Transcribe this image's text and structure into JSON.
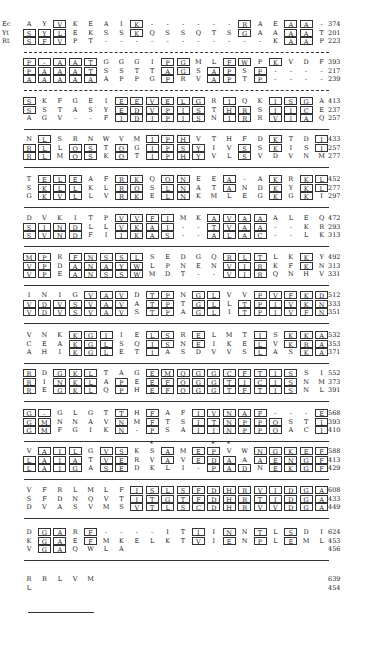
{
  "figure": {
    "species_labels": [
      "Ec",
      "Yt",
      "Rt"
    ],
    "blocks": [
      {
        "rows": [
          {
            "seq": "AYVKEAIK------RAEAA-",
            "box": "..*....*......*..**.",
            "num": "374"
          },
          {
            "seq": "SYLEKSSKQSSQTSGAAAAT",
            "box": "***....*......*..**.",
            "num": "201"
          },
          {
            "seq": "SFVPT-----------KAAP",
            "box": "***..............**.",
            "num": "223"
          }
        ],
        "sep": "dashed"
      },
      {
        "rows": [
          {
            "seq": "P-AATGGGIPGMLFWPKVDF",
            "box": "*****....**..**.*....",
            "num": "393"
          },
          {
            "seq": "PAAATSSTTAGSAPSP----",
            "box": "*****....**.**.*....",
            "num": "217"
          },
          {
            "seq": "AAAAAAPPGPRVAPTP----",
            "box": "*****....*..**.*....",
            "num": "239"
          }
        ],
        "sep": "dashed"
      },
      {
        "rows": [
          {
            "seq": "SKFGEIEEVELGRIQKISGA",
            "box": "*.....******.*..***.",
            "num": "413"
          },
          {
            "seq": "SSTASYEDVPISTHRSIICE",
            "box": "*.....******.**.***.",
            "num": "237"
          },
          {
            "seq": "AGV--FIDIPISNIRRVIAQ",
            "box": "......******.**.***.",
            "num": "257"
          }
        ],
        "sep": "solid"
      },
      {
        "rows": [
          {
            "seq": "NLSRNWVMIPHVTHFDKTDI",
            "box": ".*......***.....*..*",
            "num": "433"
          },
          {
            "seq": "RLLQSTQGIPSYIVSSKISI",
            "box": "**.**.*.****..*.*..*",
            "num": "257"
          },
          {
            "seq": "RLMQSKQTIPHYVLSVDVNM",
            "box": "**.**.*.****..*.....",
            "num": "277"
          }
        ],
        "sep": "solid"
      },
      {
        "rows": [
          {
            "seq": "TELEAFRKQQNEEA-AKRKL",
            "box": ".***..**.**..*..*.**",
            "num": "452"
          },
          {
            "seq": "SKLLKLRQSLNATANDKYKL",
            "box": ".***..**.**..*..*.**",
            "num": "277"
          },
          {
            "seq": "GKVLLVRKELNKMLEGKGKI",
            "box": ".***..**.**.....*.*.",
            "num": "297"
          }
        ],
        "sep": "solid"
      },
      {
        "rows": [
          {
            "seq": "DVKITPVVFIMKAVAAALEQ",
            "box": "......****..****....",
            "num": "472"
          },
          {
            "seq": "SINDLLVKAI--TVAA--KR",
            "box": "****..****..****....",
            "num": "293"
          },
          {
            "seq": "SVNDFIIKAS--ALAC--LK",
            "box": "****..****..****....",
            "num": "313"
          }
        ],
        "sep": "solid"
      },
      {
        "rows": [
          {
            "seq": "MPRFNSSLSEDGQRLTLKKY",
            "box": "**.*****.....***..*.",
            "num": "492"
          },
          {
            "seq": "VPDANAYWLPNENVIRKFKN",
            "box": "**.*****.....***..*.",
            "num": "313"
          },
          {
            "seq": "VPEANSSWMDT--VIRQNHV",
            "box": "**.*****.....***....",
            "num": "331"
          }
        ],
        "sep": "solid"
      },
      {
        "rows": [
          {
            "seq": "INIGVAVDTPNGLVVPVFKD",
            "box": "....***.**.**..*****",
            "num": "512"
          },
          {
            "seq": "VDVSVAVATPTGLLTPIVKN",
            "box": "*******.**.**.******",
            "num": "333"
          },
          {
            "seq": "VDVSVAVSTPAGLITPIVFN",
            "box": "*******.**.**.******",
            "num": "351"
          }
        ],
        "sep": "solid"
      },
      {
        "rows": [
          {
            "seq": "VNKKGIIELSRELMTISKKA",
            "box": "...***..**.*...*.***",
            "num": "532"
          },
          {
            "seq": "CEAKGLSQISNEIKELVKRA",
            "box": "...***..**.*...*.***",
            "num": "353"
          },
          {
            "seq": "AHIKGLETIASDVVSLASKA",
            "box": "...***..*......*..**",
            "num": "371"
          }
        ],
        "sep": "solid"
      },
      {
        "rows": [
          {
            "seq": "RDGKLTAGEMQGGCFTISSI",
            "box": "*.***...**********..",
            "num": "552"
          },
          {
            "seq": "RINKLAPEEFQGGTICISNM",
            "box": "*.***.*.**********..",
            "num": "373"
          },
          {
            "seq": "REGKLQPHEFQGGTFTISNL",
            "box": "*.***.*.**********..",
            "num": "391"
          }
        ],
        "sep": "solid"
      },
      {
        "rows": [
          {
            "seq": "G-GLGTTHFAFIVNAF---E",
            "box": "**....*.*..*****...*",
            "num": "568"
          },
          {
            "seq": "GMNNAVNMFTSITNPPQSTI",
            "box": "**....*.*..******..*",
            "num": "393"
          },
          {
            "seq": "GMFGIKN-PSAIINPPQACI",
            "box": "**....*.*..******..*",
            "num": "410"
          }
        ],
        "sep": "solid"
      },
      {
        "rows": [
          {
            "seq": "VAILGVSKSAMEPVWNGKEF",
            "box": ".***.**..*.**..*****",
            "num": "588"
          },
          {
            "seq": "LAIATVERVAVEDAAAENGF",
            "box": "****.**..*.***.*****",
            "num": "413"
          },
          {
            "seq": "LAIGASEDKLI-PADNEKGF",
            "box": "****.**.....***.*****",
            "num": "429"
          }
        ],
        "stars": [
          8,
          12,
          13
        ],
        "sep": "solid"
      },
      {
        "rows": [
          {
            "seq": "VFRLMLFISLSFDHRVIDGA",
            "box": ".......*************",
            "num": "608"
          },
          {
            "seq": "SFDNQVTITGTFDHRTIDGA",
            "box": ".......*************",
            "num": "433"
          },
          {
            "seq": "DVASVMSVTLSCDHRVVDGA",
            "box": ".......*************",
            "num": "449"
          }
        ],
        "sep": "solid"
      },
      {
        "rows": [
          {
            "seq": "DGARF----ITIINNTLSDI",
            "box": ".**.*......*.*.*.*..",
            "num": "624"
          },
          {
            "seq": "KGAEFMKELKTVIENPLEML",
            "box": ".**.*......*.*.*.*..",
            "num": "453"
          },
          {
            "seq": "VGAQWLA             ",
            "box": ".**.................",
            "num": "456"
          }
        ],
        "sep": "solid"
      },
      {
        "rows": [
          {
            "seq": "RRLVM",
            "box": ".....",
            "num": "639"
          },
          {
            "seq": "L",
            "box": ".",
            "num": "454"
          }
        ],
        "sep": "end"
      }
    ]
  }
}
